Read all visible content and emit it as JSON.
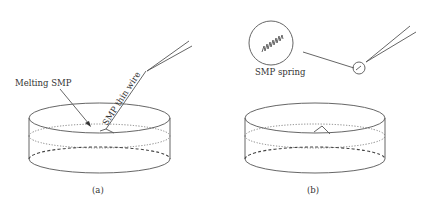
{
  "figure": {
    "panels": [
      {
        "id": "a",
        "caption": "(a)",
        "labels": {
          "melting": "Melting SMP",
          "wire": "SMP thin wire"
        }
      },
      {
        "id": "b",
        "caption": "(b)",
        "labels": {
          "spring": "SMP spring"
        }
      }
    ]
  },
  "colors": {
    "line": "#555555",
    "text": "#333333",
    "background": "#ffffff"
  }
}
